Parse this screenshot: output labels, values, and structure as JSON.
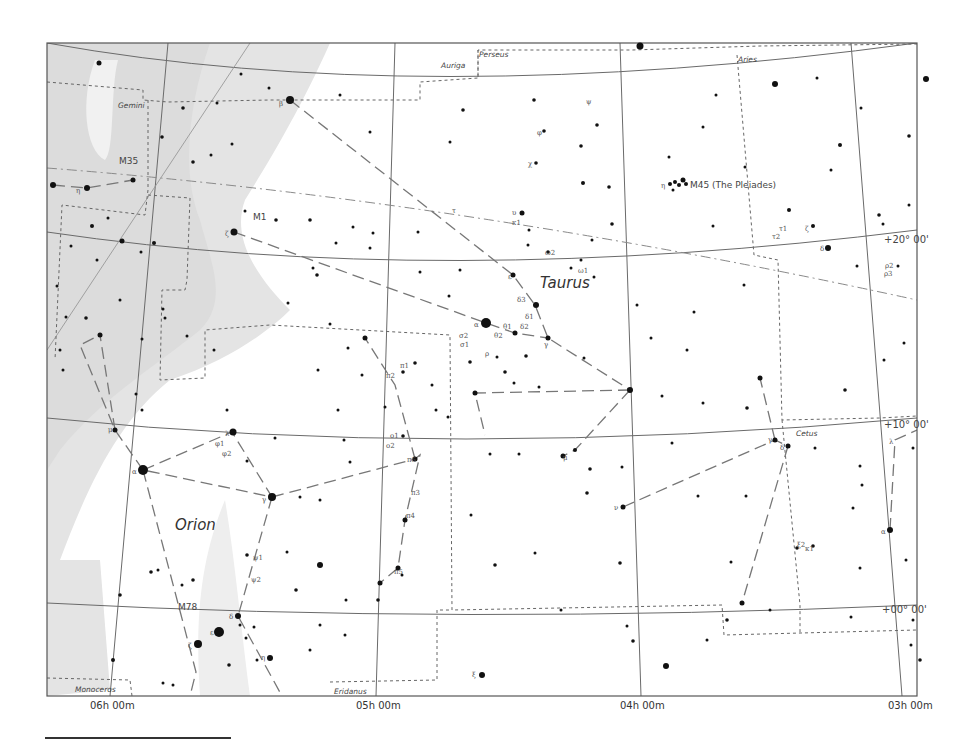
{
  "map": {
    "title": "Taurus star chart",
    "constellations": {
      "taurus": "Taurus",
      "orion": "Orion",
      "gemini": "Gemini",
      "auriga": "Auriga",
      "perseus": "Perseus",
      "aries": "Aries",
      "cetus": "Cetus",
      "monoceros": "Monoceros",
      "eridanus": "Eridanus"
    },
    "deep_sky": {
      "m45": "M45 (The Pleiades)",
      "m1": "M1",
      "m35": "M35",
      "m78": "M78"
    },
    "ra_labels": [
      "06h 00m",
      "05h 00m",
      "04h 00m",
      "03h 00m"
    ],
    "dec_labels": [
      "+20° 00'",
      "+10° 00'",
      "+00° 00'"
    ],
    "star_labels": {
      "alpha_tau": "α",
      "beta_tau": "β",
      "zeta_tau": "ζ",
      "lambda_tau": "λ",
      "epsilon_tau": "ε",
      "delta3": "δ3",
      "delta1": "δ1",
      "delta2": "δ2",
      "theta1": "θ1",
      "theta2": "θ2",
      "sigma2": "σ2",
      "sigma1": "σ1",
      "rho_tau": "ρ",
      "gamma_tau": "γ",
      "upsilon": "υ",
      "kappa1": "κ1",
      "omega1": "ω1",
      "omega2": "ω2",
      "tau": "τ",
      "chi": "χ",
      "phi": "φ",
      "psi": "ψ",
      "mu_tau": "μ",
      "nu_tau": "ν",
      "eta_tau": "η",
      "t1": "τ1",
      "t2": "τ2",
      "zeta_ari": "ζ",
      "delta_ari": "δ",
      "rho2": "ρ2",
      "rho3": "ρ3",
      "pi1": "π1",
      "pi2": "π2",
      "pi3": "π3",
      "pi4": "π4",
      "pi5": "π5",
      "pi6": "π6",
      "o1": "ο1",
      "o2": "ο2",
      "alpha_ori": "α",
      "gamma_ori": "γ",
      "lambda_ori": "λ",
      "phi1": "φ1",
      "phi2": "φ2",
      "delta_ori": "δ",
      "epsilon_ori": "ε",
      "zeta_ori": "ζ",
      "psi1": "ψ1",
      "psi2": "ψ2",
      "eta_ori": "η",
      "mu_ori": "μ",
      "eta_gem": "η",
      "xi_cet": "ξ",
      "mu_cet": "μ",
      "xi2": "ξ2",
      "nu_cet": "ν",
      "delta_cet": "δ",
      "alpha_cet": "α",
      "lambda_cet": "λ",
      "gamma_cet": "γ",
      "kappa1_cet": "κ1"
    },
    "colors": {
      "background": "#ffffff",
      "milky_way": "#e6e6e6",
      "grid": "#6a6a6a",
      "stars": "#111111"
    }
  }
}
